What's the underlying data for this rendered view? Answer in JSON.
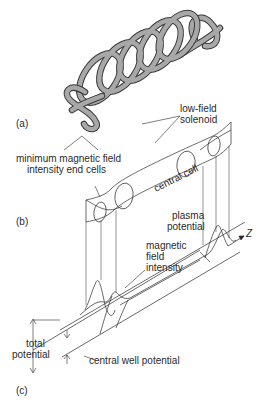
{
  "diagram": {
    "panels": [
      {
        "id": "a",
        "label": "(a)",
        "content": "coil system: helical low-field solenoid with end coils"
      },
      {
        "id": "b",
        "label": "(b)",
        "content": "plasma shape: central cell with end cells"
      },
      {
        "id": "c",
        "label": "(c)",
        "content": "axial profiles along z"
      }
    ],
    "labels": {
      "panel_a": "(a)",
      "panel_b": "(b)",
      "panel_c": "(c)",
      "solenoid_line1": "low-field",
      "solenoid_line2": "solenoid",
      "endcells_line1": "minimum magnetic field",
      "endcells_line2": "intensity end cells",
      "central_cell": "central cell",
      "plasma_line1": "plasma",
      "plasma_line2": "potential",
      "field_line1": "magnetic",
      "field_line2": "field",
      "field_line3": "intensity",
      "axis_z": "Z",
      "total_line1": "total",
      "total_line2": "potential",
      "central_well": "central well potential"
    },
    "colors": {
      "ink": "#2a2a2a",
      "coil_fill": "#a8a8a8",
      "coil_edge": "#3a3a3a",
      "background": "#ffffff"
    }
  }
}
